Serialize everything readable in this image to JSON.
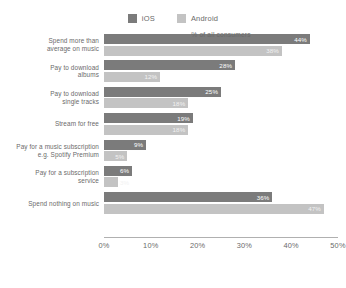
{
  "chart_data": {
    "type": "bar",
    "orientation": "horizontal",
    "title": "",
    "xlabel": "% of all consumers",
    "ylabel": "",
    "xlim": [
      0,
      50
    ],
    "xticks": [
      "0%",
      "10%",
      "20%",
      "30%",
      "40%",
      "50%"
    ],
    "xtick_values": [
      0,
      10,
      20,
      30,
      40,
      50
    ],
    "grid": false,
    "legend_position": "top-center",
    "categories": [
      "Spend more than average on music",
      "Pay to download albums",
      "Pay to download single tracks",
      "Stream for free",
      "Pay for a music subscription e.g. Spotify Premium",
      "Pay for a subscription service",
      "Spend nothing on music"
    ],
    "category_lines": [
      [
        "Spend more than",
        "average on music"
      ],
      [
        "Pay to download",
        "albums"
      ],
      [
        "Pay to download",
        "single tracks"
      ],
      [
        "Stream for free"
      ],
      [
        "Pay for a music subscription",
        "e.g. Spotify Premium"
      ],
      [
        "Pay for a subscription",
        "service"
      ],
      [
        "Spend nothing on music"
      ]
    ],
    "series": [
      {
        "name": "iOS",
        "color": "#7b7b7b",
        "values": [
          44,
          28,
          25,
          19,
          9,
          6,
          36
        ],
        "labels": [
          "44%",
          "28%",
          "25%",
          "19%",
          "9%",
          "6%",
          "36%"
        ]
      },
      {
        "name": "Android",
        "color": "#c3c3c3",
        "values": [
          38,
          12,
          18,
          18,
          5,
          3,
          47
        ],
        "labels": [
          "38%",
          "12%",
          "18%",
          "18%",
          "5%",
          "3%",
          "47%"
        ]
      }
    ]
  },
  "legend": {
    "items": [
      {
        "label": "iOS",
        "color": "#7b7b7b"
      },
      {
        "label": "Android",
        "color": "#c3c3c3"
      }
    ]
  },
  "axis": {
    "title": "% of all consumers"
  }
}
